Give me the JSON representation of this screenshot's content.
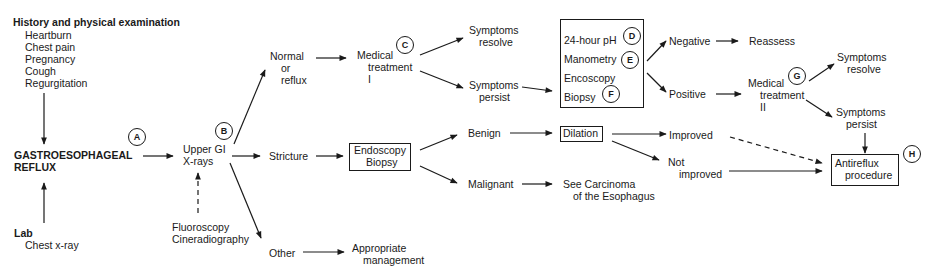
{
  "diagram": {
    "start": {
      "history": {
        "title": "History and physical examination",
        "items": [
          "Heartburn",
          "Chest pain",
          "Pregnancy",
          "Cough",
          "Regurgitation"
        ]
      },
      "main": {
        "line1": "GASTROESOPHAGEAL",
        "line2": "REFLUX",
        "marker": "A"
      },
      "lab": {
        "title": "Lab",
        "items": [
          "Chest x-ray"
        ]
      }
    },
    "upper_gi": {
      "line1": "Upper GI",
      "line2": "X-rays",
      "marker": "B"
    },
    "fluoro": {
      "line1": "Fluoroscopy",
      "line2": "Cineradiography"
    },
    "branches": {
      "normal": {
        "line1": "Normal",
        "line2": "or",
        "line3": "reflux"
      },
      "stricture": "Stricture",
      "other": "Other"
    },
    "medical1": {
      "line1": "Medical",
      "line2": "treatment",
      "line3": "I",
      "marker": "C"
    },
    "sym_resolve1": {
      "line1": "Symptoms",
      "line2": "resolve"
    },
    "sym_persist1": {
      "line1": "Symptoms",
      "line2": "persist"
    },
    "tests": {
      "items": [
        {
          "label": "24-hour pH",
          "marker": "D"
        },
        {
          "label": "Manometry",
          "marker": "E"
        },
        {
          "label": "Encoscopy",
          "marker": ""
        },
        {
          "label": "Biopsy",
          "marker": "F"
        }
      ]
    },
    "negative": "Negative",
    "reassess": "Reassess",
    "positive": "Positive",
    "medical2": {
      "line1": "Medical",
      "line2": "treatment",
      "line3": "II",
      "marker": "G"
    },
    "sym_resolve2": {
      "line1": "Symptoms",
      "line2": "resolve"
    },
    "sym_persist2": {
      "line1": "Symptoms",
      "line2": "persist"
    },
    "endo_biopsy": {
      "line1": "Endoscopy",
      "line2": "Biopsy"
    },
    "benign": "Benign",
    "malignant": "Malignant",
    "dilation": "Dilation",
    "improved": "Improved",
    "not_improved": {
      "line1": "Not",
      "line2": "improved"
    },
    "carcinoma": {
      "line1": "See Carcinoma",
      "line2": "of the Esophagus"
    },
    "appropriate": {
      "line1": "Appropriate",
      "line2": "management"
    },
    "antireflux": {
      "line1": "Antireflux",
      "line2": "procedure",
      "marker": "H"
    }
  }
}
